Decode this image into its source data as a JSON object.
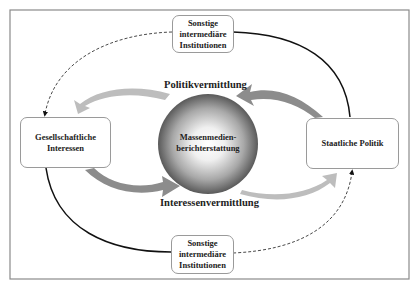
{
  "diagram": {
    "nodes": {
      "top": {
        "line1": "Sonstige",
        "line2": "intermediäre",
        "line3": "Institutionen"
      },
      "bottom": {
        "line1": "Sonstige",
        "line2": "intermediäre",
        "line3": "Institutionen"
      },
      "left": {
        "line1": "Gesellschaftliche",
        "line2": "Interessen"
      },
      "right": {
        "line1": "Staatliche Politik"
      },
      "center": {
        "line1": "Massenmedien-",
        "line2": "berichterstattung"
      }
    },
    "flows": {
      "upper": "Politikvermittlung",
      "lower": "Interessenvermittlung"
    },
    "colors": {
      "frame": "#8a8a8a",
      "solid_line": "#111111",
      "dashed_line": "#333333",
      "arrow_dark": "#8c8c8c",
      "arrow_light": "#bdbdbd",
      "sphere_dark": "#4a4a4a",
      "sphere_light": "#ffffff"
    }
  }
}
